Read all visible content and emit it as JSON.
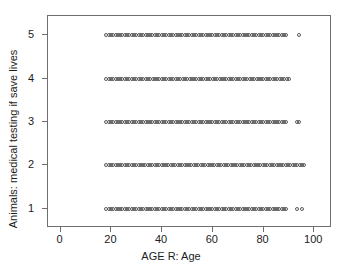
{
  "chart_data": {
    "type": "scatter",
    "title": "",
    "xlabel": "AGE R: Age",
    "ylabel": "Animals: medical testing if save lives",
    "xlim": [
      -5,
      107
    ],
    "ylim": [
      0.55,
      5.45
    ],
    "grid": false,
    "legend": null,
    "xticks": [
      0,
      20,
      40,
      60,
      80,
      100
    ],
    "xticklabels": [
      "0",
      "20",
      "40",
      "60",
      "80",
      "100"
    ],
    "yticks": [
      1,
      2,
      3,
      4,
      5
    ],
    "yticklabels": [
      "1",
      "2",
      "3",
      "4",
      "5"
    ],
    "marker": "open-circle",
    "marker_color": "#5a5a5a",
    "series": [
      {
        "name": "Animals: medical testing if save lives = 5",
        "y": 5,
        "x_range": [
          18,
          89
        ],
        "x_outliers": [
          94
        ]
      },
      {
        "name": "Animals: medical testing if save lives = 4",
        "y": 4,
        "x_range": [
          18,
          90
        ],
        "x_outliers": []
      },
      {
        "name": "Animals: medical testing if save lives = 3",
        "y": 3,
        "x_range": [
          18,
          89
        ],
        "x_outliers": [
          93,
          94
        ]
      },
      {
        "name": "Animals: medical testing if save lives = 2",
        "y": 2,
        "x_range": [
          18,
          96
        ],
        "x_outliers": []
      },
      {
        "name": "Animals: medical testing if save lives = 1",
        "y": 1,
        "x_range": [
          18,
          89
        ],
        "x_outliers": [
          93,
          95
        ]
      }
    ]
  },
  "axes": {
    "x_title": "AGE R: Age",
    "y_title": "Animals: medical testing if save lives"
  },
  "colors": {
    "frame": "#6e6e6e",
    "marker": "#5a5a5a",
    "text": "#1c1c1c",
    "background": "#ffffff"
  }
}
